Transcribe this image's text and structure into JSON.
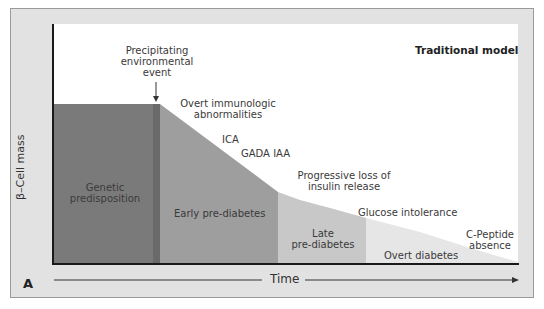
{
  "figure": {
    "panel_label": "A",
    "title": "Traditional model",
    "y_axis_label": "β–Cell mass",
    "x_axis_label": "Time"
  },
  "annotations": {
    "trigger": "Precipitating environmental event",
    "trigger_lines": [
      "Precipitating",
      "environmental",
      "event"
    ],
    "immunologic_lines": [
      "Overt immunologic",
      "abnormalities"
    ],
    "ica": "ICA",
    "gada_iaa": "GADA IAA",
    "insulin_loss_lines": [
      "Progressive loss of",
      "insulin release"
    ],
    "glucose": "Glucose intolerance",
    "cpeptide_lines": [
      "C-Peptide",
      "absence"
    ]
  },
  "stages": [
    {
      "name": "Genetic predisposition",
      "lines": [
        "Genetic",
        "predisposition"
      ],
      "color": "#7a7a7a"
    },
    {
      "name": "Early pre-diabetes",
      "lines": [
        "Early pre-diabetes"
      ],
      "color": "#9e9e9e"
    },
    {
      "name": "Late pre-diabetes",
      "lines": [
        "Late",
        "pre-diabetes"
      ],
      "color": "#c8c8c8"
    },
    {
      "name": "Overt diabetes",
      "lines": [
        "Overt diabetes"
      ],
      "color": "#e6e6e6"
    }
  ],
  "colors": {
    "frame": "#e2e2e2",
    "trigger_stripe": "#6a6a6a",
    "axis": "#1a1a1a"
  }
}
